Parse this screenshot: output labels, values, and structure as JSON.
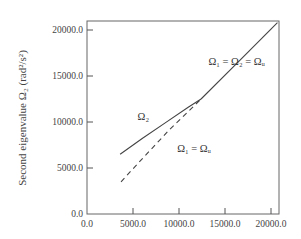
{
  "chart_data": {
    "type": "line",
    "title": "",
    "xlabel": "",
    "ylabel": "Second eigenvalue  Ω₂   (rad²/s²)",
    "xlim": [
      0,
      21000
    ],
    "ylim": [
      0,
      21000
    ],
    "x_ticks": [
      0,
      5000,
      10000,
      15000,
      20000
    ],
    "x_tick_labels": [
      "0.0",
      "5000.0",
      "10000.0",
      "15000.0",
      "20000.0"
    ],
    "y_ticks": [
      0,
      5000,
      10000,
      15000,
      20000
    ],
    "y_tick_labels": [
      "0.0",
      "5000.0",
      "10000.0",
      "15000.0",
      "20000.0"
    ],
    "grid": false,
    "legend": null,
    "series": [
      {
        "name": "Ω₂",
        "style": "solid",
        "x": [
          3600,
          6000,
          8500,
          11000,
          12400
        ],
        "y": [
          6500,
          8200,
          9900,
          11600,
          12500
        ]
      },
      {
        "name": "Ω₁ = Ωᵤ",
        "style": "dashed",
        "x": [
          3700,
          6000,
          9000,
          12400
        ],
        "y": [
          3500,
          6000,
          9200,
          12500
        ]
      },
      {
        "name": "Ω₁ = Ω₂ = Ωᵤ",
        "style": "solid",
        "x": [
          12400,
          16500,
          20700
        ],
        "y": [
          12500,
          16600,
          20800
        ]
      }
    ],
    "annotations": [
      {
        "text": "Ω₁ = Ω₂ = Ωᵤ",
        "x": 13200,
        "y": 16200
      },
      {
        "text": "Ω₂",
        "x": 5500,
        "y": 10200
      },
      {
        "text": "Ω₁ = Ωᵤ",
        "x": 9800,
        "y": 6700
      }
    ]
  },
  "labels": {
    "ylabel": "Second eigenvalue  Ω₂   (rad²/s²)",
    "annot_upper": "Ω₁ = Ω₂ = Ωᵤ",
    "annot_mid": "Ω₂",
    "annot_lower": "Ω₁ = Ωᵤ"
  }
}
